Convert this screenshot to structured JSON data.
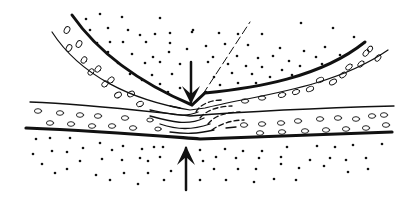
{
  "figure": {
    "ink_color": "#111111",
    "background": "#ffffff",
    "elements": {
      "upper_plate": "curved band with ovals, thick lower boundary line",
      "lower_plate": "near-horizontal band with ovals, thick lower boundary line",
      "arrow_down": "compression arrow from above",
      "arrow_up": "compression arrow from below",
      "dashed_line": "thin dashed guide line from contact point up-right",
      "deformation_zone": "short dashes showing folded layers at the contact"
    },
    "labels": []
  }
}
